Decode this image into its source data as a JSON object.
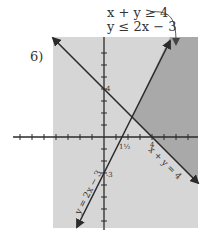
{
  "problem_number": "6)",
  "inequalities": [
    "x + y ≥ 4",
    "y ≤ 2x − 3"
  ],
  "lines": [
    {
      "equation": "x + y = 4",
      "label": "x + y = 4"
    },
    {
      "equation": "y = 2x − 3",
      "label": "y = 2x − 3"
    }
  ],
  "axis_labels": {
    "y_intercept_1": "4",
    "y_intercept_2": "-3",
    "x_intercept_1": "1½",
    "x_intercept_2": "4"
  },
  "colors": {
    "light_shade": "#d6d6d6",
    "dark_shade": "#a9a9a9",
    "line": "#2b2b2b",
    "text": "#333333"
  }
}
